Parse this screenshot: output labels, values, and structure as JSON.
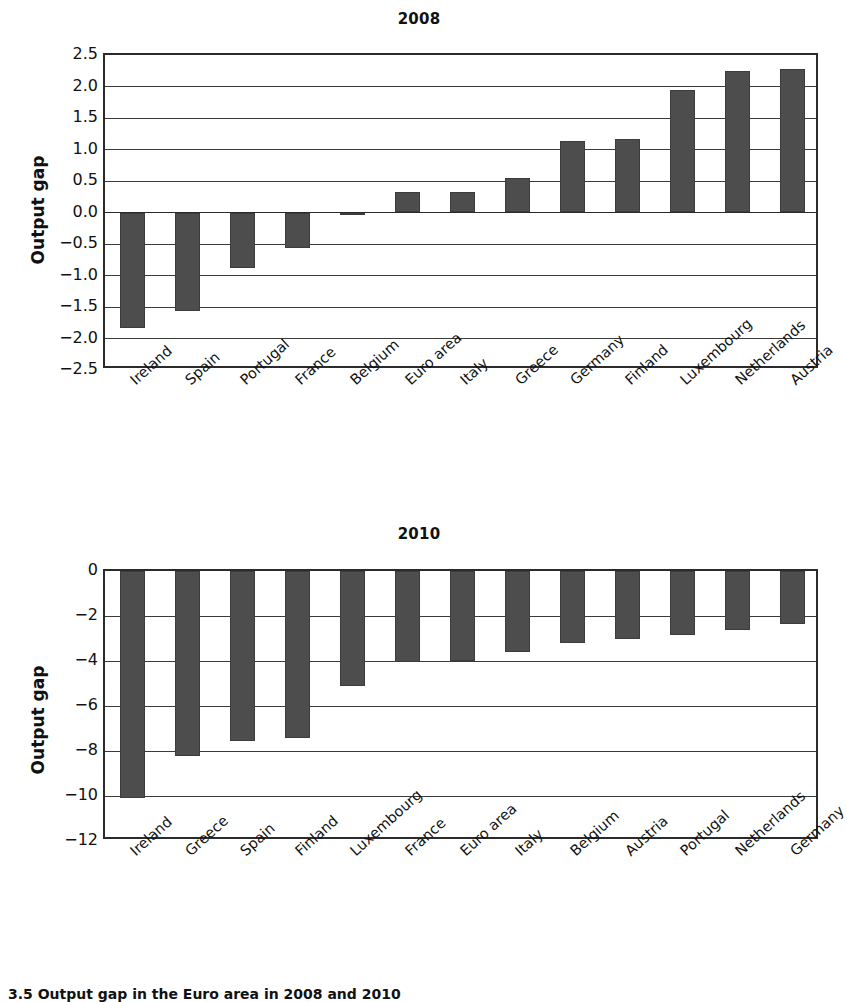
{
  "figure": {
    "caption": "3.5  Output gap in the Euro area in 2008 and 2010",
    "bar_color": "#4d4d4d",
    "axis_color": "#2b2b2b",
    "grid_color": "#3a3a3a"
  },
  "chart_data": [
    {
      "type": "bar",
      "title": "2008",
      "xlabel": "",
      "ylabel": "Output gap",
      "ylim": [
        -2.5,
        2.5
      ],
      "ytick_labels": [
        "2.5",
        "2.0",
        "1.5",
        "1.0",
        "0.5",
        "0.0",
        "−0.5",
        "−1.0",
        "−1.5",
        "−2.0",
        "−2.5"
      ],
      "yticks": [
        2.5,
        2.0,
        1.5,
        1.0,
        0.5,
        0.0,
        -0.5,
        -1.0,
        -1.5,
        -2.0,
        -2.5
      ],
      "grid": true,
      "legend": "none",
      "categories": [
        "Ireland",
        "Spain",
        "Portugal",
        "France",
        "Belgium",
        "Euro area",
        "Italy",
        "Greece",
        "Germany",
        "Finland",
        "Luxembourg",
        "Netherlands",
        "Austria"
      ],
      "values": [
        -1.83,
        -1.57,
        -0.88,
        -0.57,
        -0.02,
        0.33,
        0.33,
        0.54,
        1.13,
        1.16,
        1.94,
        2.24,
        2.27
      ]
    },
    {
      "type": "bar",
      "title": "2010",
      "xlabel": "",
      "ylabel": "Output gap",
      "ylim": [
        -12,
        0
      ],
      "ytick_labels": [
        "0",
        "−2",
        "−4",
        "−6",
        "−8",
        "−10",
        "−12"
      ],
      "yticks": [
        0,
        -2,
        -4,
        -6,
        -8,
        -10,
        -12
      ],
      "grid": true,
      "legend": "none",
      "categories": [
        "Ireland",
        "Greece",
        "Spain",
        "Finland",
        "Luxembourg",
        "France",
        "Euro area",
        "Italy",
        "Belgium",
        "Austria",
        "Portugal",
        "Netherlands",
        "Germany"
      ],
      "values": [
        -10.1,
        -8.2,
        -7.55,
        -7.4,
        -5.1,
        -4.05,
        -4.0,
        -3.6,
        -3.2,
        -3.0,
        -2.85,
        -2.6,
        -2.35
      ]
    }
  ]
}
